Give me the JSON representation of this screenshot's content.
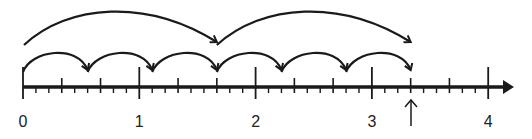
{
  "diagram": {
    "type": "number-line-jumps",
    "axis": {
      "min": 0,
      "max": 4,
      "subdivisions_per_unit": 9,
      "medium_ticks_every": 3,
      "labels": [
        "0",
        "1",
        "2",
        "3",
        "4"
      ],
      "color": "#1a1a1a"
    },
    "small_jumps": {
      "size": "5/9",
      "count": 6,
      "landings": [
        "5/9",
        "10/9",
        "15/9",
        "20/9",
        "25/9",
        "30/9"
      ]
    },
    "large_jumps": {
      "size": "5/3",
      "count": 2,
      "landings": [
        "5/3",
        "10/3"
      ]
    },
    "marker": {
      "icon": "up-arrow-icon",
      "value": "3 1/3"
    }
  }
}
